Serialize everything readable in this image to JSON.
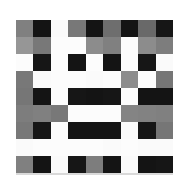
{
  "figure": {
    "title": "",
    "background_color": "#ffffff",
    "edge_shadow_color": "#d9d9d9"
  },
  "chart_data": {
    "type": "heatmap",
    "title": "",
    "subtitle": "",
    "xlabel": "",
    "ylabel": "",
    "colormap": "gray",
    "grid": false,
    "legend": "none",
    "value_range": [
      0,
      255
    ],
    "rows": 9,
    "cols": 9,
    "x": [
      0,
      1,
      2,
      3,
      4,
      5,
      6,
      7,
      8
    ],
    "y": [
      0,
      1,
      2,
      3,
      4,
      5,
      6,
      7,
      8
    ],
    "xticklabels": [],
    "yticklabels": [],
    "values": [
      [
        128,
        20,
        250,
        120,
        20,
        110,
        20,
        105,
        22
      ],
      [
        150,
        120,
        252,
        252,
        140,
        128,
        252,
        140,
        125
      ],
      [
        252,
        22,
        252,
        20,
        252,
        20,
        252,
        22,
        250
      ],
      [
        120,
        250,
        252,
        252,
        250,
        252,
        140,
        252,
        118
      ],
      [
        118,
        20,
        252,
        22,
        20,
        22,
        252,
        20,
        20
      ],
      [
        125,
        128,
        120,
        252,
        252,
        252,
        132,
        130,
        128
      ],
      [
        120,
        22,
        252,
        20,
        20,
        20,
        250,
        22,
        118
      ],
      [
        250,
        252,
        252,
        252,
        252,
        250,
        252,
        250,
        250
      ],
      [
        128,
        20,
        250,
        22,
        125,
        20,
        250,
        20,
        22
      ]
    ],
    "cell_colors": [
      [
        "#808080",
        "#141414",
        "#fafafa",
        "#787878",
        "#141414",
        "#6e6e6e",
        "#141414",
        "#696969",
        "#161616"
      ],
      [
        "#969696",
        "#787878",
        "#fcfcfc",
        "#fcfcfc",
        "#8c8c8c",
        "#808080",
        "#fcfcfc",
        "#8c8c8c",
        "#7d7d7d"
      ],
      [
        "#fcfcfc",
        "#161616",
        "#fcfcfc",
        "#141414",
        "#fcfcfc",
        "#141414",
        "#fcfcfc",
        "#161616",
        "#fafafa"
      ],
      [
        "#787878",
        "#fafafa",
        "#fcfcfc",
        "#fcfcfc",
        "#fafafa",
        "#fcfcfc",
        "#8c8c8c",
        "#fcfcfc",
        "#767676"
      ],
      [
        "#767676",
        "#141414",
        "#fcfcfc",
        "#161616",
        "#141414",
        "#161616",
        "#fcfcfc",
        "#141414",
        "#141414"
      ],
      [
        "#7d7d7d",
        "#808080",
        "#787878",
        "#fcfcfc",
        "#fcfcfc",
        "#fcfcfc",
        "#848484",
        "#828282",
        "#808080"
      ],
      [
        "#787878",
        "#161616",
        "#fcfcfc",
        "#141414",
        "#141414",
        "#141414",
        "#fafafa",
        "#161616",
        "#767676"
      ],
      [
        "#fafafa",
        "#fcfcfc",
        "#fcfcfc",
        "#fcfcfc",
        "#fcfcfc",
        "#fafafa",
        "#fcfcfc",
        "#fafafa",
        "#fafafa"
      ],
      [
        "#808080",
        "#141414",
        "#fafafa",
        "#161616",
        "#7d7d7d",
        "#141414",
        "#fafafa",
        "#141414",
        "#161616"
      ]
    ]
  }
}
